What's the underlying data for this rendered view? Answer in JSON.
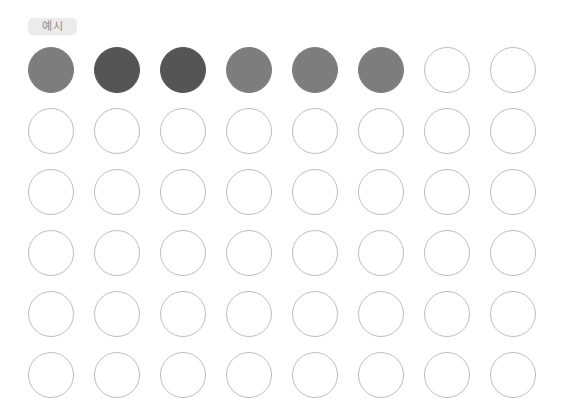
{
  "label": "예시",
  "colors": {
    "medium": "#7d7d7d",
    "dark": "#555555",
    "outline": "#bdbdbd",
    "badge_bg": "#ebebeb",
    "badge_text": "#8a8a8a"
  },
  "grid": {
    "rows": 6,
    "cols": 8,
    "cells": [
      [
        "medium",
        "dark",
        "dark",
        "medium",
        "medium",
        "medium",
        "empty",
        "empty"
      ],
      [
        "empty",
        "empty",
        "empty",
        "empty",
        "empty",
        "empty",
        "empty",
        "empty"
      ],
      [
        "empty",
        "empty",
        "empty",
        "empty",
        "empty",
        "empty",
        "empty",
        "empty"
      ],
      [
        "empty",
        "empty",
        "empty",
        "empty",
        "empty",
        "empty",
        "empty",
        "empty"
      ],
      [
        "empty",
        "empty",
        "empty",
        "empty",
        "empty",
        "empty",
        "empty",
        "empty"
      ],
      [
        "empty",
        "empty",
        "empty",
        "empty",
        "empty",
        "empty",
        "empty",
        "empty"
      ]
    ]
  }
}
